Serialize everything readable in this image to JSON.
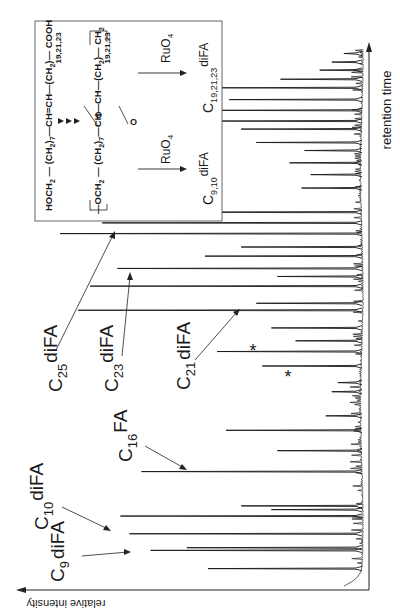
{
  "figure": {
    "type": "gas-chromatogram",
    "orientation": "rotated-90-ccw"
  },
  "axes": {
    "x_label": "retention time",
    "y_label": "relative intensity"
  },
  "peak_labels": [
    {
      "id": "c9",
      "base": "C",
      "sub": "9",
      "suffix": "diFA"
    },
    {
      "id": "c10",
      "base": "C",
      "sub": "10",
      "suffix": "diFA"
    },
    {
      "id": "c16",
      "base": "C",
      "sub": "16",
      "suffix": "FA"
    },
    {
      "id": "c21",
      "base": "C",
      "sub": "21",
      "suffix": "diFA"
    },
    {
      "id": "c23",
      "base": "C",
      "sub": "23",
      "suffix": "diFA"
    },
    {
      "id": "c25",
      "base": "C",
      "sub": "25",
      "suffix": "diFA"
    }
  ],
  "markers": {
    "asterisk": "*"
  },
  "inset": {
    "line1": {
      "parts": [
        "HOCH",
        "2",
        " — (CH",
        "2",
        ")",
        "7",
        "—CH=CH—(CH",
        "2",
        ")— COOH"
      ],
      "subscript_repeat": "19,21,23"
    },
    "line2": {
      "parts": [
        "—OCH",
        "2",
        " — (CH",
        "2",
        ")",
        "7",
        "—CH—CH—(CH",
        "2",
        ")— CH",
        "2"
      ],
      "subscript_repeat": "19,21,23"
    },
    "epoxy_label": "O",
    "reagent": "RuO",
    "reagent_sub": "4",
    "product_left": {
      "base": "C",
      "sub": "9,10",
      "suffix": "diFA"
    },
    "product_right": {
      "base": "C",
      "sub": "19,21,23",
      "suffix": "diFA"
    }
  },
  "chart_data": {
    "type": "line",
    "title": "",
    "xlabel": "retention time",
    "ylabel": "relative intensity",
    "x_range": [
      0,
      100
    ],
    "y_range": [
      0,
      100
    ],
    "grid": false,
    "legend": "none",
    "labeled_peaks": [
      {
        "label": "C9 diFA",
        "x": 5.9,
        "y": 70
      },
      {
        "label": "C10 diFA",
        "x": 9.0,
        "y": 77
      },
      {
        "label": "C16 FA",
        "x": 20.6,
        "y": 73
      },
      {
        "label": "C21 diFA",
        "x": 50.7,
        "y": 94
      },
      {
        "label": "C23 diFA",
        "x": 58.5,
        "y": 81
      },
      {
        "label": "C25 diFA",
        "x": 65.0,
        "y": 100
      },
      {
        "label": "*",
        "x": 43.0,
        "y": 48
      },
      {
        "label": "*",
        "x": 40.3,
        "y": 33
      }
    ],
    "other_peaks": [
      {
        "x": 2.5,
        "y": 51
      },
      {
        "x": 6.4,
        "y": 58
      },
      {
        "x": 12.3,
        "y": 80
      },
      {
        "x": 13.5,
        "y": 30
      },
      {
        "x": 14.2,
        "y": 40
      },
      {
        "x": 24.5,
        "y": 28
      },
      {
        "x": 28.3,
        "y": 45
      },
      {
        "x": 31.0,
        "y": 12
      },
      {
        "x": 35.5,
        "y": 10
      },
      {
        "x": 37.2,
        "y": 8
      },
      {
        "x": 45.0,
        "y": 22
      },
      {
        "x": 47.4,
        "y": 30
      },
      {
        "x": 52.0,
        "y": 35
      },
      {
        "x": 55.2,
        "y": 90
      },
      {
        "x": 57.0,
        "y": 28
      },
      {
        "x": 60.8,
        "y": 52
      },
      {
        "x": 62.5,
        "y": 40
      },
      {
        "x": 67.0,
        "y": 86
      },
      {
        "x": 69.0,
        "y": 74
      },
      {
        "x": 73.5,
        "y": 20
      },
      {
        "x": 76.0,
        "y": 17
      },
      {
        "x": 78.2,
        "y": 24
      },
      {
        "x": 80.5,
        "y": 19
      },
      {
        "x": 82.0,
        "y": 35
      },
      {
        "x": 84.5,
        "y": 40
      },
      {
        "x": 86.0,
        "y": 52
      },
      {
        "x": 88.0,
        "y": 50
      },
      {
        "x": 90.0,
        "y": 44
      },
      {
        "x": 92.2,
        "y": 48
      },
      {
        "x": 93.8,
        "y": 27
      },
      {
        "x": 95.5,
        "y": 14
      },
      {
        "x": 97.0,
        "y": 10
      },
      {
        "x": 98.6,
        "y": 6
      }
    ],
    "annotations": [
      "*",
      "*"
    ]
  }
}
